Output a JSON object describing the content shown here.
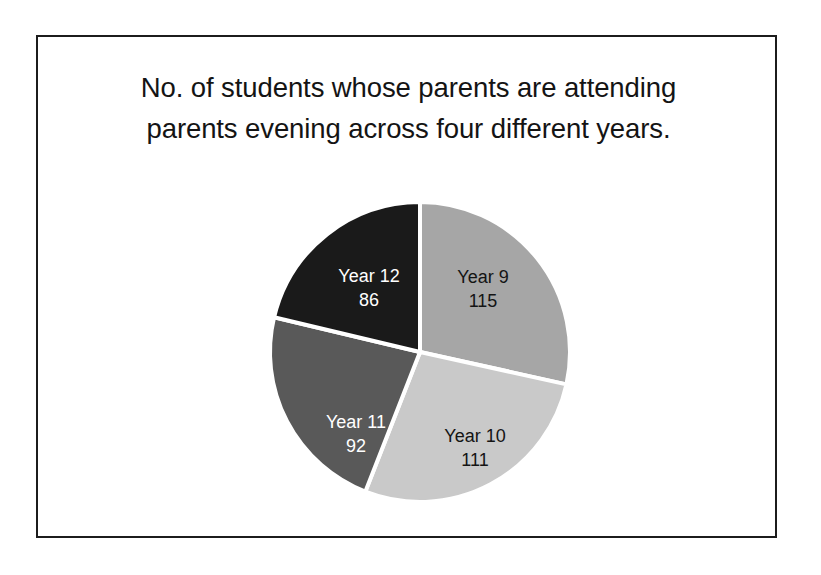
{
  "slide": {
    "background_color": "#ffffff",
    "border_color": "#1c1c1c",
    "title_line_1": "No. of students whose parents are attending",
    "title_line_2": "parents evening across four different years.",
    "title_color": "#141414"
  },
  "chart_data": {
    "type": "pie",
    "title": "No. of students whose parents are attending parents evening across four different years.",
    "xlabel": "",
    "ylabel": "",
    "legend": "none",
    "grid": false,
    "total": 404,
    "start_angle_deg": 0,
    "direction": "clockwise",
    "categories": [
      "Year 9",
      "Year 10",
      "Year 11",
      "Year 12"
    ],
    "values": [
      115,
      111,
      92,
      86
    ],
    "slices": [
      {
        "label": "Year 9",
        "value": 115,
        "value_text": "115",
        "percent": 28.5,
        "angle_deg": 102.5,
        "color": "#a6a6a6",
        "text_color": "#141414",
        "label_x": 213,
        "label_y": 76,
        "value_x": 213,
        "value_y": 100
      },
      {
        "label": "Year 10",
        "value": 111,
        "value_text": "111",
        "percent": 27.5,
        "angle_deg": 98.9,
        "color": "#c9c9c9",
        "text_color": "#141414",
        "label_x": 205,
        "label_y": 235,
        "value_x": 205,
        "value_y": 259
      },
      {
        "label": "Year 11",
        "value": 92,
        "value_text": "92",
        "percent": 22.8,
        "angle_deg": 82.0,
        "color": "#595959",
        "text_color": "#ffffff",
        "label_x": 86,
        "label_y": 221,
        "value_x": 86,
        "value_y": 245
      },
      {
        "label": "Year 12",
        "value": 86,
        "value_text": "86",
        "percent": 21.3,
        "angle_deg": 76.6,
        "color": "#1a1a1a",
        "text_color": "#ffffff",
        "label_x": 99,
        "label_y": 75,
        "value_x": 99,
        "value_y": 99
      }
    ],
    "geometry": {
      "center_x": 150,
      "center_y": 150,
      "radius": 150,
      "separator_color": "#ffffff",
      "separator_width": 4
    }
  }
}
